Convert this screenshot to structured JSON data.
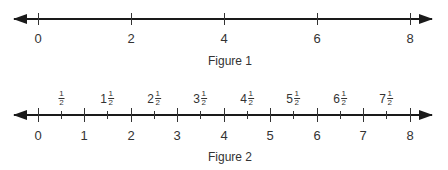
{
  "figure1": {
    "caption": "Figure 1",
    "ticks": [
      "0",
      "2",
      "4",
      "6",
      "8"
    ]
  },
  "figure2": {
    "caption": "Figure 2",
    "ticks": [
      "0",
      "1",
      "2",
      "3",
      "4",
      "5",
      "6",
      "7",
      "8"
    ],
    "half_labels": [
      {
        "whole": "",
        "num": "1",
        "den": "2"
      },
      {
        "whole": "1",
        "num": "1",
        "den": "2"
      },
      {
        "whole": "2",
        "num": "1",
        "den": "2"
      },
      {
        "whole": "3",
        "num": "1",
        "den": "2"
      },
      {
        "whole": "4",
        "num": "1",
        "den": "2"
      },
      {
        "whole": "5",
        "num": "1",
        "den": "2"
      },
      {
        "whole": "6",
        "num": "1",
        "den": "2"
      },
      {
        "whole": "7",
        "num": "1",
        "den": "2"
      }
    ]
  }
}
